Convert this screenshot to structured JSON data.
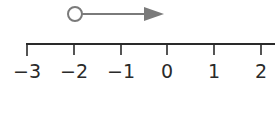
{
  "number_line": {
    "min": -3,
    "max": 2,
    "ticks": [
      "−3",
      "−2",
      "−1",
      "0",
      "1",
      "2"
    ],
    "tick_x": [
      27,
      74,
      121,
      167,
      214,
      261
    ],
    "line_color": "#2a2a2a"
  },
  "ray": {
    "start_value": -2,
    "endpoint": "open-circle",
    "direction": "right",
    "color": "#7a7a7a"
  }
}
